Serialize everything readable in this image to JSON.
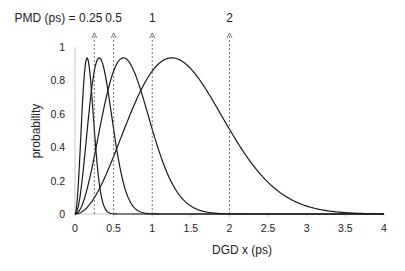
{
  "chart_data": {
    "type": "line",
    "title": "",
    "xlabel": "DGD x  (ps)",
    "ylabel": "probability",
    "xlim": [
      0,
      4
    ],
    "ylim": [
      0,
      1
    ],
    "x_ticks": [
      "0",
      "0.5",
      "1",
      "1.5",
      "2",
      "2.5",
      "3",
      "3.5",
      "4"
    ],
    "x_tick_values": [
      0,
      0.5,
      1,
      1.5,
      2,
      2.5,
      3,
      3.5,
      4
    ],
    "y_ticks": [
      "0",
      "0.2",
      "0.4",
      "0.6",
      "0.8",
      "1"
    ],
    "y_tick_values": [
      0,
      0.2,
      0.4,
      0.6,
      0.8,
      1
    ],
    "grid": false,
    "annotation_prefix": "PMD (ps) = ",
    "peak_value": 0.935,
    "series": [
      {
        "name": "PMD 0.25 ps",
        "pmd": 0.25,
        "label": "0.25",
        "distribution": "maxwellian"
      },
      {
        "name": "PMD 0.5 ps",
        "pmd": 0.5,
        "label": "0.5",
        "distribution": "maxwellian"
      },
      {
        "name": "PMD 1 ps",
        "pmd": 1,
        "label": "1",
        "distribution": "maxwellian"
      },
      {
        "name": "PMD 2 ps",
        "pmd": 2,
        "label": "2",
        "distribution": "maxwellian"
      }
    ]
  }
}
